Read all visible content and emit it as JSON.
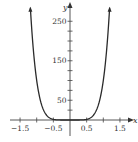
{
  "chart_data": {
    "type": "line",
    "title": "",
    "xlabel": "x",
    "ylabel": "y",
    "function": "y = 100x^6",
    "xlim": [
      -1.8,
      1.8
    ],
    "ylim": [
      -40,
      300
    ],
    "x_ticks": [
      -1.5,
      -1,
      -0.5,
      0,
      0.5,
      1,
      1.5
    ],
    "x_tick_labels": [
      "-1.5",
      "",
      "-0.5",
      "",
      "0.5",
      "",
      "1.5"
    ],
    "y_ticks": [
      25,
      50,
      75,
      100,
      125,
      150,
      175,
      200,
      225,
      250
    ],
    "y_tick_labels": [
      "",
      "50",
      "",
      "",
      "",
      "150",
      "",
      "",
      "",
      "250"
    ],
    "grid": false,
    "legend": null,
    "series": [
      {
        "name": "curve",
        "x": [
          -1.19,
          -1.1,
          -1.0,
          -0.9,
          -0.8,
          -0.7,
          -0.6,
          -0.5,
          -0.4,
          -0.3,
          -0.2,
          0,
          0.2,
          0.3,
          0.4,
          0.5,
          0.6,
          0.7,
          0.8,
          0.9,
          1.0,
          1.1,
          1.19
        ],
        "y": [
          284,
          177,
          100,
          53,
          26,
          12,
          5,
          1.6,
          0.4,
          0.07,
          0,
          0,
          0,
          0.07,
          0.4,
          1.6,
          5,
          12,
          26,
          53,
          100,
          177,
          284
        ],
        "color": "#2b2b2b",
        "arrows_at_ends": true
      }
    ]
  },
  "colors": {
    "axis": "#444444",
    "curve": "#2b2b2b",
    "text": "#333333",
    "background": "#ffffff"
  }
}
